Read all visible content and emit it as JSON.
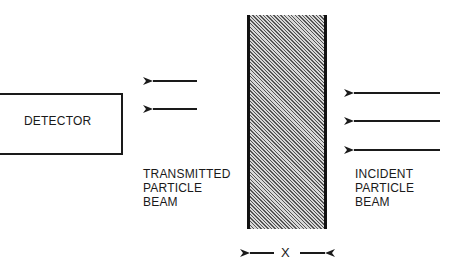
{
  "diagram": {
    "detector": {
      "label": "DETECTOR"
    },
    "transmitted_beam": {
      "lines": [
        "TRANSMITTED",
        "PARTICLE",
        "BEAM"
      ],
      "arrow_count": 2
    },
    "incident_beam": {
      "lines": [
        "INCIDENT",
        "PARTICLE",
        "BEAM"
      ],
      "arrow_count": 3
    },
    "slab": {
      "thickness_label": "X",
      "fill": "diagonal-hatch"
    },
    "colors": {
      "ink": "#1a1a1a",
      "background": "#ffffff",
      "hatch": "#555555"
    }
  }
}
